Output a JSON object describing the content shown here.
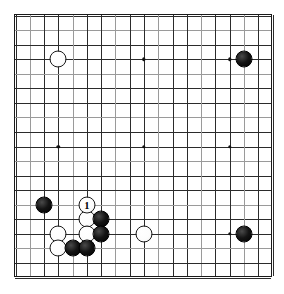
{
  "diagram": {
    "kind": "go-board-diagram",
    "board_size": 19,
    "background_color": "#ffffff",
    "line_color": "#2b2b2b",
    "border_color": "#1a1a1a",
    "black_color": "#000000",
    "white_color": "#ffffff",
    "star_points": [
      {
        "col": 3,
        "row": 3
      },
      {
        "col": 9,
        "row": 3
      },
      {
        "col": 15,
        "row": 3
      },
      {
        "col": 3,
        "row": 9
      },
      {
        "col": 9,
        "row": 9
      },
      {
        "col": 15,
        "row": 9
      },
      {
        "col": 3,
        "row": 15
      },
      {
        "col": 9,
        "row": 15
      },
      {
        "col": 15,
        "row": 15
      }
    ],
    "stones": [
      {
        "color": "white",
        "col": 3,
        "row": 3,
        "label": ""
      },
      {
        "color": "black",
        "col": 16,
        "row": 3,
        "label": ""
      },
      {
        "color": "black",
        "col": 2,
        "row": 13,
        "label": ""
      },
      {
        "color": "white",
        "col": 5,
        "row": 13,
        "label": "1"
      },
      {
        "color": "white",
        "col": 5,
        "row": 14,
        "label": ""
      },
      {
        "color": "black",
        "col": 6,
        "row": 14,
        "label": ""
      },
      {
        "color": "white",
        "col": 3,
        "row": 15,
        "label": ""
      },
      {
        "color": "white",
        "col": 5,
        "row": 15,
        "label": ""
      },
      {
        "color": "black",
        "col": 6,
        "row": 15,
        "label": ""
      },
      {
        "color": "white",
        "col": 9,
        "row": 15,
        "label": ""
      },
      {
        "color": "black",
        "col": 16,
        "row": 15,
        "label": ""
      },
      {
        "color": "white",
        "col": 3,
        "row": 16,
        "label": ""
      },
      {
        "color": "black",
        "col": 4,
        "row": 16,
        "label": ""
      },
      {
        "color": "black",
        "col": 5,
        "row": 16,
        "label": ""
      }
    ],
    "move_numbers": [
      "1"
    ]
  }
}
